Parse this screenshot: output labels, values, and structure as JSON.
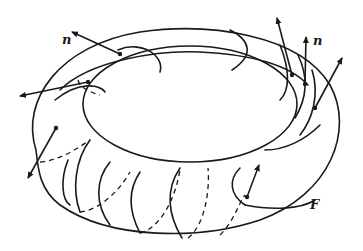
{
  "figure": {
    "labels": {
      "normal_left": "n",
      "normal_right": "n",
      "surface": "F"
    },
    "colors": {
      "ink": "#1a1a1a",
      "background": "#ffffff"
    }
  }
}
